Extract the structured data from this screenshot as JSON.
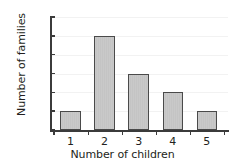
{
  "chart_data": {
    "type": "bar",
    "title": "",
    "xlabel": "Number of children",
    "ylabel": "Number of families",
    "categories": [
      "1",
      "2",
      "3",
      "4",
      "5"
    ],
    "values": [
      5,
      25,
      15,
      10,
      5
    ],
    "ylim": [
      0,
      30
    ],
    "yticks": [
      0,
      5,
      10,
      15,
      20,
      25,
      30
    ],
    "ytick_labels": [
      "0",
      "5",
      "10",
      "15",
      "20",
      "25",
      "30"
    ],
    "grid": true,
    "legend": "none",
    "bar_fill_color": "#c7c7c7",
    "bar_edge_color": "#4a4a4a",
    "axis_color": "#3b3b3b",
    "text_color": "#231f20",
    "background_color": "#ffffff"
  }
}
